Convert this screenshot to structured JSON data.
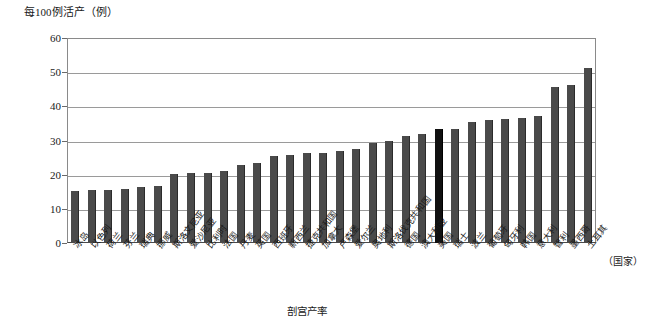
{
  "chart_data": {
    "type": "bar",
    "title": "",
    "ylabel": "每100例活产（例）",
    "xlabel": "剖宫产率",
    "x_unit_label": "（国家）",
    "ylim": [
      0,
      60
    ],
    "ytick_labels": [
      "0",
      "10",
      "20",
      "30",
      "40",
      "50",
      "60"
    ],
    "ytick_values": [
      0,
      10,
      20,
      30,
      40,
      50,
      60
    ],
    "grid": true,
    "legend": "none",
    "highlight_category": "美国",
    "colors": {
      "bar": "#4a4a4a",
      "highlight_bar": "#111111",
      "gridline": "#9a9a9a",
      "axis": "#8a8a8a",
      "text": "#1a1a1a"
    },
    "categories": [
      "冰岛",
      "以色列",
      "荷兰",
      "芬兰",
      "瑞典",
      "挪威",
      "斯洛文尼亚",
      "爱沙尼亚",
      "比利时",
      "法国",
      "丹麦",
      "英国",
      "西班牙",
      "新西兰",
      "捷克共和国",
      "加拿大",
      "卢森堡",
      "爱尔兰",
      "奥地利",
      "斯洛伐克共和国",
      "德国",
      "澳大利亚",
      "美国",
      "瑞士",
      "波兰",
      "葡萄牙",
      "匈牙利",
      "韩国",
      "意大利",
      "智利",
      "墨西哥",
      "土耳其"
    ],
    "values": [
      15.2,
      15.4,
      15.6,
      15.9,
      16.5,
      16.7,
      20.3,
      20.5,
      20.6,
      21.0,
      22.8,
      23.4,
      25.4,
      25.8,
      26.2,
      26.4,
      26.8,
      27.5,
      29.2,
      30.0,
      31.3,
      31.8,
      33.4,
      33.5,
      35.5,
      36.0,
      36.4,
      36.7,
      37.1,
      45.8,
      46.3,
      51.3
    ],
    "series_name": "剖宫产率"
  }
}
